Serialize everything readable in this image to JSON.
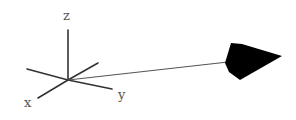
{
  "diagram": {
    "type": "3d-vector",
    "colors": {
      "axis": "#333333",
      "vector": "#555555",
      "arrowhead": "#000000",
      "label": "#555555"
    },
    "origin": [
      68,
      80
    ],
    "axes": [
      {
        "name": "z",
        "label": "z",
        "end": [
          68,
          30
        ],
        "label_pos": [
          63,
          20
        ]
      },
      {
        "name": "x",
        "label": "x",
        "end": [
          38,
          98
        ],
        "label_pos": [
          24,
          107
        ]
      },
      {
        "name": "y",
        "label": "y",
        "end": [
          112,
          89
        ],
        "label_pos": [
          118,
          99
        ]
      },
      {
        "name": "neg-x",
        "label": "",
        "end": [
          27,
          69
        ]
      },
      {
        "name": "neg-y",
        "label": "",
        "end": [
          98,
          63
        ]
      }
    ],
    "vector": {
      "start": [
        68,
        80
      ],
      "end": [
        226,
        62
      ],
      "arrowhead": [
        [
          225,
          63
        ],
        [
          231,
          43
        ],
        [
          242,
          44
        ],
        [
          282,
          56
        ],
        [
          240,
          80
        ],
        [
          229,
          72
        ]
      ]
    }
  }
}
